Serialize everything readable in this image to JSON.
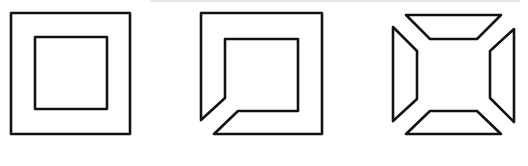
{
  "figure": {
    "stroke_color": "#111111",
    "background": "#ffffff",
    "panels": [
      {
        "id": "concentric-squares",
        "description": "outer square with inner square",
        "outer": {
          "x": 11,
          "y": 13,
          "w": 119,
          "h": 121
        },
        "inner": {
          "x": 35,
          "y": 37,
          "w": 72,
          "h": 72
        }
      },
      {
        "id": "cut-square-frame",
        "description": "square frame with a diagonal cut at bottom-left corner",
        "path": "M201,13 L322,13 L322,134 L214,134 L238,111 L298,111 L298,39 L225,39 L225,98 L201,120 Z"
      },
      {
        "id": "four-trapezoids",
        "description": "square frame split into four trapezoids at the corners",
        "top": "406,15 501,15 477,39 430,39",
        "bottom": "406,134 501,134 477,111 430,111",
        "left": "393,27 417,51 417,99 393,121",
        "right": "514,29 490,51 490,98 514,122"
      }
    ]
  }
}
